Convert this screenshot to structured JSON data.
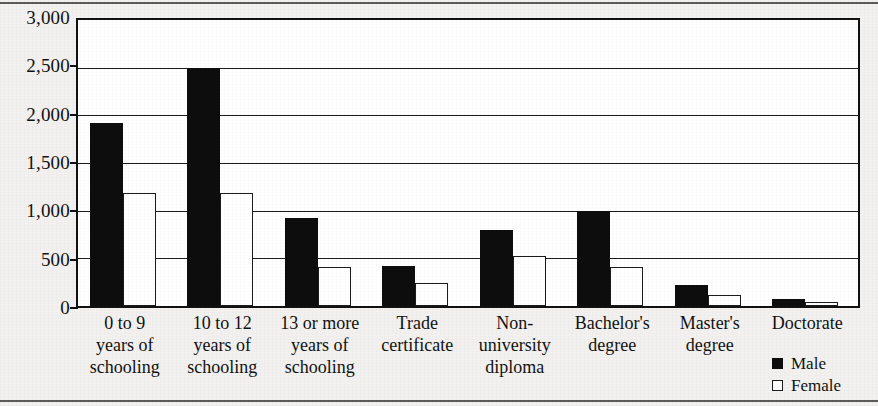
{
  "chart_data": {
    "type": "bar",
    "title": "",
    "subtitle": "",
    "xlabel": "",
    "ylabel": "",
    "grid": true,
    "legend_position": "bottom-right",
    "ylim": [
      0,
      3000
    ],
    "ytick_labels": [
      "3,000",
      "2,500",
      "2,000",
      "1,500",
      "1,000",
      "500",
      "0"
    ],
    "ytick_values": [
      3000,
      2500,
      2000,
      1500,
      1000,
      500,
      0
    ],
    "categories": [
      "0 to 9 years of schooling",
      "10 to 12 years of schooling",
      "13 or more years of schooling",
      "Trade certificate",
      "Non-university diploma",
      "Bachelor's degree",
      "Master's degree",
      "Doctorate"
    ],
    "category_lines": [
      [
        "0 to 9",
        "years of",
        "schooling"
      ],
      [
        "10 to 12",
        "years of",
        "schooling"
      ],
      [
        "13 or more",
        "years of",
        "schooling"
      ],
      [
        "Trade",
        "certificate"
      ],
      [
        "Non-",
        "university",
        "diploma"
      ],
      [
        "Bachelor's",
        "degree"
      ],
      [
        "Master's",
        "degree"
      ],
      [
        "Doctorate"
      ]
    ],
    "series": [
      {
        "name": "Male",
        "color": "#0d0d0d",
        "values": [
          1920,
          2500,
          920,
          420,
          800,
          1000,
          225,
          70
        ]
      },
      {
        "name": "Female",
        "color": "#ffffff",
        "values": [
          1190,
          1190,
          410,
          240,
          520,
          410,
          115,
          45
        ]
      }
    ]
  },
  "legend": {
    "items": [
      {
        "label": "Male",
        "swatch": "filled-square-icon"
      },
      {
        "label": "Female",
        "swatch": "open-square-icon"
      }
    ]
  }
}
